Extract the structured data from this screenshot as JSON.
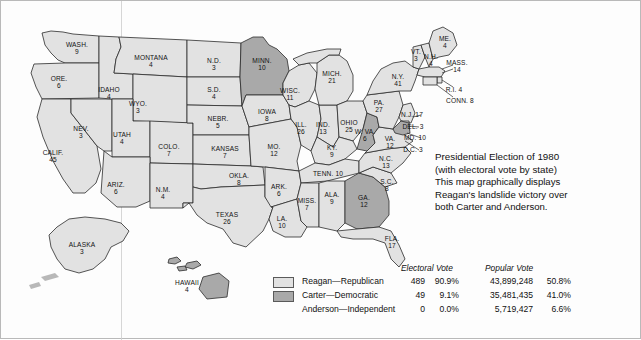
{
  "caption": {
    "line1": "Presidential Election of 1980",
    "line2": "(with electoral vote by state)",
    "line3": "This map graphically displays",
    "line4": "Reagan's landslide victory over",
    "line5": "both Carter and Anderson."
  },
  "legend": {
    "electoral_header": "Electoral Vote",
    "popular_header": "Popular Vote",
    "rows": [
      {
        "name": "Reagan—Republican",
        "swatch": "#e2e2e2",
        "electoral": "489",
        "electoral_pct": "90.9%",
        "popular": "43,899,248",
        "popular_pct": "50.8%"
      },
      {
        "name": "Carter—Democratic",
        "swatch": "#a9a9a9",
        "electoral": "49",
        "electoral_pct": "9.1%",
        "popular": "35,481,435",
        "popular_pct": "41.0%"
      },
      {
        "name": "Anderson—Independent",
        "swatch": null,
        "electoral": "0",
        "electoral_pct": "0.0%",
        "popular": "5,719,427",
        "popular_pct": "6.6%"
      }
    ]
  },
  "colors": {
    "reagan": "#e2e2e2",
    "carter": "#a9a9a9",
    "outline": "#2b2b2b",
    "ocean": "#ffffff"
  },
  "chart_data": {
    "type": "map",
    "title": "Presidential Election of 1980 (with electoral vote by state)",
    "legend_position": "bottom-center",
    "categories": [
      "Reagan—Republican",
      "Carter—Democratic",
      "Anderson—Independent"
    ],
    "series": [
      {
        "name": "Electoral Vote",
        "values": [
          489,
          49,
          0
        ]
      },
      {
        "name": "Electoral Vote %",
        "values": [
          90.9,
          9.1,
          0.0
        ]
      },
      {
        "name": "Popular Vote",
        "values": [
          43899248,
          35481435,
          5719427
        ]
      },
      {
        "name": "Popular Vote %",
        "values": [
          50.8,
          41.0,
          6.6
        ]
      }
    ],
    "states": [
      {
        "name": "WASH.",
        "ev": 4,
        "label": "WASH.",
        "votes": "9",
        "winner": "reagan",
        "x": 74,
        "y": 47
      },
      {
        "name": "ORE.",
        "ev": 6,
        "label": "ORE.",
        "votes": "6",
        "winner": "reagan",
        "x": 57,
        "y": 80
      },
      {
        "name": "CALIF.",
        "ev": 45,
        "label": "CALIF.",
        "votes": "45",
        "winner": "reagan",
        "x": 52,
        "y": 154
      },
      {
        "name": "IDAHO",
        "ev": 4,
        "label": "IDAHO",
        "votes": "4",
        "winner": "reagan",
        "x": 107,
        "y": 90
      },
      {
        "name": "NEV.",
        "ev": 3,
        "label": "NEV.",
        "votes": "3",
        "winner": "reagan",
        "x": 80,
        "y": 130
      },
      {
        "name": "MONTANA",
        "ev": 4,
        "label": "MONTANA",
        "votes": "4",
        "winner": "reagan",
        "x": 150,
        "y": 60
      },
      {
        "name": "WYO.",
        "ev": 3,
        "label": "WYO.",
        "votes": "3",
        "winner": "reagan",
        "x": 136,
        "y": 105
      },
      {
        "name": "UTAH",
        "ev": 4,
        "label": "UTAH",
        "votes": "4",
        "winner": "reagan",
        "x": 120,
        "y": 137
      },
      {
        "name": "COLO.",
        "ev": 7,
        "label": "COLO.",
        "votes": "7",
        "winner": "reagan",
        "x": 168,
        "y": 148
      },
      {
        "name": "ARIZ.",
        "ev": 6,
        "label": "ARIZ.",
        "votes": "6",
        "winner": "reagan",
        "x": 114,
        "y": 186
      },
      {
        "name": "N.M.",
        "ev": 4,
        "label": "N.M.",
        "votes": "4",
        "winner": "reagan",
        "x": 161,
        "y": 191
      },
      {
        "name": "N.D.",
        "ev": 3,
        "label": "N.D.",
        "votes": "3",
        "winner": "reagan",
        "x": 213,
        "y": 62
      },
      {
        "name": "S.D.",
        "ev": 4,
        "label": "S.D.",
        "votes": "4",
        "winner": "reagan",
        "x": 213,
        "y": 91
      },
      {
        "name": "NEBR.",
        "ev": 5,
        "label": "NEBR.",
        "votes": "5",
        "winner": "reagan",
        "x": 216,
        "y": 120
      },
      {
        "name": "KANSAS",
        "ev": 7,
        "label": "KANSAS",
        "votes": "7",
        "winner": "reagan",
        "x": 223,
        "y": 150
      },
      {
        "name": "OKLA.",
        "ev": 8,
        "label": "OKLA.",
        "votes": "8",
        "winner": "reagan",
        "x": 237,
        "y": 177
      },
      {
        "name": "TEXAS",
        "ev": 26,
        "label": "TEXAS",
        "votes": "26",
        "winner": "reagan",
        "x": 226,
        "y": 216
      },
      {
        "name": "MINN.",
        "ev": 10,
        "label": "MINN.",
        "votes": "10",
        "winner": "carter",
        "x": 261,
        "y": 62
      },
      {
        "name": "IOWA",
        "ev": 8,
        "label": "IOWA",
        "votes": "8",
        "winner": "reagan",
        "x": 266,
        "y": 113
      },
      {
        "name": "MO.",
        "ev": 12,
        "label": "MO.",
        "votes": "12",
        "winner": "reagan",
        "x": 273,
        "y": 148
      },
      {
        "name": "ARK.",
        "ev": 6,
        "label": "ARK.",
        "votes": "6",
        "winner": "reagan",
        "x": 278,
        "y": 188
      },
      {
        "name": "LA.",
        "ev": 10,
        "label": "LA.",
        "votes": "10",
        "winner": "reagan",
        "x": 281,
        "y": 220
      },
      {
        "name": "WISC.",
        "ev": 11,
        "label": "WISC.",
        "votes": "11",
        "winner": "reagan",
        "x": 288,
        "y": 92
      },
      {
        "name": "ILL.",
        "ev": 26,
        "label": "ILL.",
        "votes": "26",
        "winner": "reagan",
        "x": 300,
        "y": 126
      },
      {
        "name": "MISS.",
        "ev": 7,
        "label": "MISS.",
        "votes": "7",
        "winner": "reagan",
        "x": 305,
        "y": 202
      },
      {
        "name": "MICH.",
        "ev": 21,
        "label": "MICH.",
        "votes": "21",
        "winner": "reagan",
        "x": 330,
        "y": 75
      },
      {
        "name": "IND.",
        "ev": 13,
        "label": "IND.",
        "votes": "13",
        "winner": "reagan",
        "x": 322,
        "y": 126
      },
      {
        "name": "OHIO",
        "ev": 25,
        "label": "OHIO",
        "votes": "25",
        "winner": "reagan",
        "x": 348,
        "y": 124
      },
      {
        "name": "KY.",
        "ev": 9,
        "label": "KY.",
        "votes": "9",
        "winner": "reagan",
        "x": 330,
        "y": 149
      },
      {
        "name": "TENN.",
        "ev": 10,
        "label": "TENN. 10",
        "votes": "10",
        "winner": "reagan",
        "x": 326,
        "y": 173
      },
      {
        "name": "ALA.",
        "ev": 9,
        "label": "ALA.",
        "votes": "9",
        "winner": "reagan",
        "x": 330,
        "y": 196
      },
      {
        "name": "GA.",
        "ev": 12,
        "label": "GA.",
        "votes": "12",
        "winner": "carter",
        "x": 363,
        "y": 199
      },
      {
        "name": "FLA.",
        "ev": 17,
        "label": "FLA.",
        "votes": "17",
        "winner": "reagan",
        "x": 390,
        "y": 240
      },
      {
        "name": "S.C.",
        "ev": 8,
        "label": "S.C.",
        "votes": "8",
        "winner": "reagan",
        "x": 385,
        "y": 183
      },
      {
        "name": "N.C.",
        "ev": 13,
        "label": "N.C.",
        "votes": "13",
        "winner": "reagan",
        "x": 384,
        "y": 160
      },
      {
        "name": "W. VA.",
        "ev": 6,
        "label": "W. VA.",
        "votes": "6",
        "winner": "carter",
        "x": 364,
        "y": 133
      },
      {
        "name": "VA.",
        "ev": 12,
        "label": "VA.",
        "votes": "12",
        "winner": "reagan",
        "x": 388,
        "y": 140
      },
      {
        "name": "PA.",
        "ev": 27,
        "label": "PA.",
        "votes": "27",
        "winner": "reagan",
        "x": 378,
        "y": 104
      },
      {
        "name": "N.Y.",
        "ev": 41,
        "label": "N.Y.",
        "votes": "41",
        "winner": "reagan",
        "x": 397,
        "y": 78
      },
      {
        "name": "VT.",
        "ev": 3,
        "label": "VT.",
        "votes": "3",
        "winner": "reagan",
        "x": 414,
        "y": 53
      },
      {
        "name": "N.H.",
        "ev": 4,
        "label": "N.H.",
        "votes": "4",
        "winner": "reagan",
        "x": 429,
        "y": 58
      },
      {
        "name": "ME.",
        "ev": 4,
        "label": "ME.",
        "votes": "4",
        "winner": "reagan",
        "x": 443,
        "y": 40
      },
      {
        "name": "MASS.",
        "ev": 14,
        "label": "MASS.",
        "votes": "14",
        "winner": "reagan",
        "x": 452,
        "y": 64
      },
      {
        "name": "R.I.",
        "ev": 4,
        "label": "R.I. 4",
        "votes": "4",
        "winner": "reagan",
        "x": 452,
        "y": 89
      },
      {
        "name": "CONN.",
        "ev": 8,
        "label": "CONN. 8",
        "votes": "8",
        "winner": "reagan",
        "x": 456,
        "y": 100
      },
      {
        "name": "N.J.",
        "ev": 17,
        "label": "N.J. 17",
        "votes": "17",
        "winner": "reagan",
        "x": 408,
        "y": 114
      },
      {
        "name": "DEL.",
        "ev": 3,
        "label": "DEL. 3",
        "votes": "3",
        "winner": "reagan",
        "x": 412,
        "y": 126
      },
      {
        "name": "MD.",
        "ev": 10,
        "label": "MD. 10",
        "votes": "10",
        "winner": "carter",
        "x": 413,
        "y": 137
      },
      {
        "name": "D.C.",
        "ev": 3,
        "label": "D.C. 3",
        "votes": "3",
        "winner": "carter",
        "x": 412,
        "y": 149
      },
      {
        "name": "ALASKA",
        "ev": 3,
        "label": "ALASKA",
        "votes": "3",
        "winner": "reagan",
        "x": 81,
        "y": 246
      },
      {
        "name": "HAWAII",
        "ev": 4,
        "label": "HAWAII",
        "votes": "4",
        "winner": "carter",
        "x": 186,
        "y": 284
      }
    ]
  },
  "map_labels": [
    {
      "name": "WASH.",
      "votes": "9",
      "x": 76,
      "y": 47,
      "style": "stack"
    },
    {
      "name": "ORE.",
      "votes": "6",
      "x": 58,
      "y": 81,
      "style": "stack"
    },
    {
      "name": "IDAHO",
      "votes": "4",
      "x": 108,
      "y": 92,
      "style": "stack"
    },
    {
      "name": "MONTANA",
      "votes": "4",
      "x": 150,
      "y": 60,
      "style": "stack"
    },
    {
      "name": "CALIF.",
      "votes": "45",
      "x": 52,
      "y": 155,
      "style": "stack"
    },
    {
      "name": "NEV.",
      "votes": "3",
      "x": 80,
      "y": 131,
      "style": "stack"
    },
    {
      "name": "UTAH",
      "votes": "4",
      "x": 121,
      "y": 137,
      "style": "stack"
    },
    {
      "name": "WYO.",
      "votes": "3",
      "x": 137,
      "y": 106,
      "style": "stack"
    },
    {
      "name": "COLO.",
      "votes": "7",
      "x": 168,
      "y": 149,
      "style": "stack"
    },
    {
      "name": "ARIZ.",
      "votes": "6",
      "x": 115,
      "y": 187,
      "style": "stack"
    },
    {
      "name": "N.M.",
      "votes": "4",
      "x": 162,
      "y": 192,
      "style": "stack"
    },
    {
      "name": "N.D.",
      "votes": "3",
      "x": 213,
      "y": 63,
      "style": "stack"
    },
    {
      "name": "S.D.",
      "votes": "4",
      "x": 213,
      "y": 92,
      "style": "stack"
    },
    {
      "name": "NEBR.",
      "votes": "5",
      "x": 217,
      "y": 121,
      "style": "stack"
    },
    {
      "name": "KANSAS",
      "votes": "7",
      "x": 224,
      "y": 151,
      "style": "stack"
    },
    {
      "name": "OKLA.",
      "votes": "8",
      "x": 238,
      "y": 178,
      "style": "stack"
    },
    {
      "name": "TEXAS",
      "votes": "26",
      "x": 226,
      "y": 217,
      "style": "stack"
    },
    {
      "name": "MINN.",
      "votes": "10",
      "x": 261,
      "y": 63,
      "style": "stack"
    },
    {
      "name": "IOWA",
      "votes": "8",
      "x": 266,
      "y": 114,
      "style": "stack"
    },
    {
      "name": "MO.",
      "votes": "12",
      "x": 273,
      "y": 149,
      "style": "stack"
    },
    {
      "name": "ARK.",
      "votes": "6",
      "x": 278,
      "y": 189,
      "style": "stack"
    },
    {
      "name": "LA.",
      "votes": "10",
      "x": 281,
      "y": 221,
      "style": "stack"
    },
    {
      "name": "WISC.",
      "votes": "11",
      "x": 289,
      "y": 93,
      "style": "stack"
    },
    {
      "name": "ILL.",
      "votes": "26",
      "x": 300,
      "y": 127,
      "style": "stack"
    },
    {
      "name": "MISS.",
      "votes": "7",
      "x": 306,
      "y": 203,
      "style": "stack"
    },
    {
      "name": "MICH.",
      "votes": "21",
      "x": 331,
      "y": 76,
      "style": "stack"
    },
    {
      "name": "IND.",
      "votes": "13",
      "x": 322,
      "y": 127,
      "style": "stack"
    },
    {
      "name": "OHIO",
      "votes": "25",
      "x": 348,
      "y": 125,
      "style": "stack"
    },
    {
      "name": "KY.",
      "votes": "9",
      "x": 331,
      "y": 150,
      "style": "stack"
    },
    {
      "name": "ALA.",
      "votes": "9",
      "x": 331,
      "y": 197,
      "style": "stack"
    },
    {
      "name": "GA.",
      "votes": "12",
      "x": 363,
      "y": 200,
      "style": "stack"
    },
    {
      "name": "FLA.",
      "votes": "17",
      "x": 391,
      "y": 241,
      "style": "stack"
    },
    {
      "name": "S.C.",
      "votes": "8",
      "x": 386,
      "y": 184,
      "style": "stack"
    },
    {
      "name": "N.C.",
      "votes": "13",
      "x": 385,
      "y": 161,
      "style": "stack"
    },
    {
      "name": "W. VA.",
      "votes": "6",
      "x": 364,
      "y": 134,
      "style": "stack"
    },
    {
      "name": "VA.",
      "votes": "12",
      "x": 389,
      "y": 141,
      "style": "stack"
    },
    {
      "name": "PA.",
      "votes": "27",
      "x": 378,
      "y": 105,
      "style": "stack"
    },
    {
      "name": "N.Y.",
      "votes": "41",
      "x": 397,
      "y": 79,
      "style": "stack"
    },
    {
      "name": "VT.",
      "votes": "3",
      "x": 415,
      "y": 54,
      "style": "stack"
    },
    {
      "name": "N.H.",
      "votes": "4",
      "x": 430,
      "y": 59,
      "style": "stack"
    },
    {
      "name": "ME.",
      "votes": "4",
      "x": 444,
      "y": 41,
      "style": "stack"
    },
    {
      "name": "MASS.",
      "votes": "14",
      "x": 456,
      "y": 65,
      "style": "stack"
    },
    {
      "name": "TENN.",
      "votes": "10",
      "x": 327,
      "y": 173,
      "style": "inline"
    },
    {
      "name": "R.I.",
      "votes": "4",
      "x": 453,
      "y": 89,
      "style": "inline"
    },
    {
      "name": "CONN.",
      "votes": "8",
      "x": 459,
      "y": 100,
      "style": "inline"
    },
    {
      "name": "N.J.",
      "votes": "17",
      "x": 411,
      "y": 114,
      "style": "inline"
    },
    {
      "name": "DEL.",
      "votes": "3",
      "x": 412,
      "y": 126,
      "style": "inline"
    },
    {
      "name": "MD.",
      "votes": "10",
      "x": 414,
      "y": 137,
      "style": "inline"
    },
    {
      "name": "D.C.",
      "votes": "3",
      "x": 412,
      "y": 149,
      "style": "inline"
    },
    {
      "name": "ALASKA",
      "votes": "3",
      "x": 81,
      "y": 247,
      "style": "stack"
    },
    {
      "name": "HAWAII",
      "votes": "4",
      "x": 186,
      "y": 285,
      "style": "stack"
    }
  ]
}
